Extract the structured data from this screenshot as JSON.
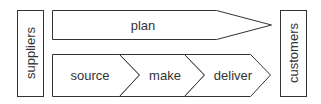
{
  "diagram": {
    "left_box": {
      "label": "suppliers"
    },
    "right_box": {
      "label": "customers"
    },
    "top_arrow": {
      "label": "plan"
    },
    "chevrons": [
      {
        "label": "source"
      },
      {
        "label": "make"
      },
      {
        "label": "deliver"
      }
    ],
    "colors": {
      "stroke": "#333333",
      "text": "#333333",
      "fill": "#ffffff"
    }
  }
}
